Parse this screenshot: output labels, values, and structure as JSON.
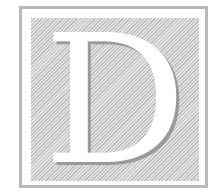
{
  "initial": {
    "letter": "D",
    "colors": {
      "frame": "#b9b9b9",
      "hatch_light": "#e2e2e2",
      "hatch_dark": "#bcbcbc",
      "letter": "#ffffff",
      "letter_shadow": "#9a9a9a"
    }
  }
}
